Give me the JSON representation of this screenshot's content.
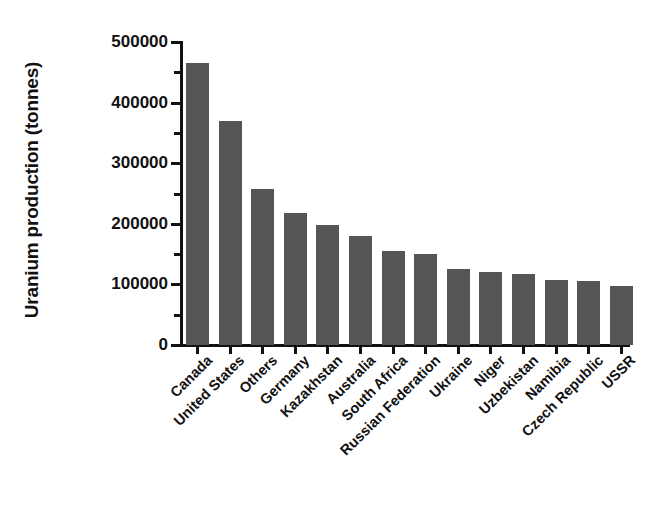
{
  "chart_data": {
    "type": "bar",
    "title": "",
    "xlabel": "",
    "ylabel": "Uranium production (tonnes)",
    "ylim": [
      0,
      500000
    ],
    "grid": false,
    "legend": false,
    "bar_color": "#555555",
    "axis_color": "#111111",
    "background_color": "#ffffff",
    "y_ticks": [
      0,
      100000,
      200000,
      300000,
      400000,
      500000
    ],
    "y_tick_labels": [
      "0",
      "100000",
      "200000",
      "300000",
      "400000",
      "500000"
    ],
    "y_minor_ticks": [
      50000,
      150000,
      250000,
      350000,
      450000
    ],
    "categories": [
      "Canada",
      "United States",
      "Others",
      "Germany",
      "Kazakhstan",
      "Australia",
      "South Africa",
      "Russian Federation",
      "Ukraine",
      "Niger",
      "Uzbekistan",
      "Namibia",
      "Czech Republic",
      "USSR"
    ],
    "values": [
      465000,
      370000,
      258000,
      218000,
      198000,
      180000,
      155000,
      150000,
      125000,
      120000,
      118000,
      108000,
      106000,
      97000
    ]
  }
}
